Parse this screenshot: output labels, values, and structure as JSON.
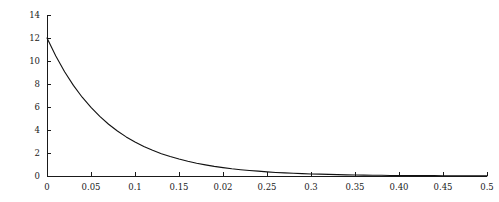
{
  "figure": {
    "background_color": "#ffffff",
    "axis_color": "#1a1a1a",
    "curve_color": "#111111"
  },
  "geometry": {
    "x_origin_px": 47,
    "y_origin_px": 176,
    "x_end_px": 487,
    "y_top_px": 15,
    "tick_length_px": 4
  },
  "chart_data": {
    "type": "line",
    "title": "",
    "subtitle": "",
    "xlabel": "",
    "ylabel": "",
    "xlim": [
      0,
      0.5
    ],
    "ylim": [
      0,
      14
    ],
    "grid": false,
    "legend": null,
    "legend_position": "none",
    "annotations": [],
    "xticks": [
      0,
      0.05,
      0.1,
      0.15,
      0.2,
      0.25,
      0.3,
      0.35,
      0.4,
      0.45,
      0.5
    ],
    "xtick_labels": [
      "0",
      "0.05",
      "0.1",
      "0.15",
      "0.02",
      "0.25",
      "0.3",
      "0.35",
      "0.40",
      "0.45",
      "0.5"
    ],
    "yticks": [
      0,
      2,
      4,
      6,
      8,
      10,
      12,
      14
    ],
    "ytick_labels": [
      "0",
      "2",
      "4",
      "6",
      "8",
      "10",
      "12",
      "14"
    ],
    "series": [
      {
        "name": "decay",
        "x": [
          0,
          0.01,
          0.02,
          0.03,
          0.04,
          0.05,
          0.06,
          0.07,
          0.08,
          0.09,
          0.1,
          0.11,
          0.12,
          0.13,
          0.14,
          0.15,
          0.16,
          0.17,
          0.18,
          0.19,
          0.2,
          0.21,
          0.22,
          0.23,
          0.24,
          0.25,
          0.26,
          0.27,
          0.28,
          0.29,
          0.3,
          0.31,
          0.32,
          0.33,
          0.34,
          0.35,
          0.36,
          0.37,
          0.38,
          0.39,
          0.4,
          0.41,
          0.42,
          0.43,
          0.44,
          0.45,
          0.46,
          0.47,
          0.48,
          0.49,
          0.5
        ],
        "y": [
          12.0,
          10.43,
          9.07,
          7.88,
          6.85,
          5.96,
          5.18,
          4.5,
          3.91,
          3.4,
          2.96,
          2.57,
          2.24,
          1.94,
          1.69,
          1.47,
          1.28,
          1.11,
          0.97,
          0.84,
          0.73,
          0.63,
          0.55,
          0.48,
          0.42,
          0.36,
          0.31,
          0.27,
          0.24,
          0.21,
          0.18,
          0.16,
          0.14,
          0.12,
          0.1,
          0.09,
          0.08,
          0.07,
          0.06,
          0.05,
          0.04,
          0.04,
          0.03,
          0.03,
          0.03,
          0.02,
          0.02,
          0.02,
          0.01,
          0.01,
          0.01
        ]
      }
    ]
  }
}
